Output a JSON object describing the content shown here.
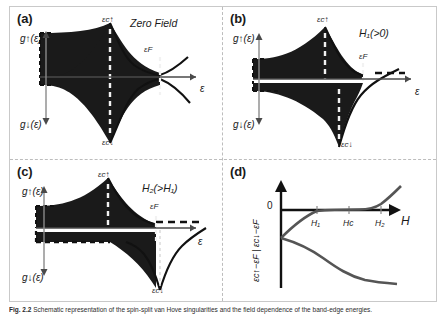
{
  "figure": {
    "caption_bold": "Fig. 2.2",
    "caption_text": "Schematic representation of the spin-split van Hove singularities and the field dependence of the band-edge energies."
  },
  "panels": {
    "a": {
      "label": "(a)",
      "condition": "Zero Field",
      "y_axis_up": "g↑(ε)",
      "y_axis_down": "g↓(ε)",
      "x_axis": "ε",
      "peak_up": "εc↑",
      "peak_down": "εc↓",
      "fermi": "εF"
    },
    "b": {
      "label": "(b)",
      "condition": "H₁(>0)",
      "y_axis_up": "g↑(ε)",
      "y_axis_down": "g↓(ε)",
      "x_axis": "ε",
      "peak_up": "εc↑",
      "peak_down": "εc↓",
      "fermi": "εF"
    },
    "c": {
      "label": "(c)",
      "condition": "H₂(>H₁)",
      "y_axis_up": "g↑(ε)",
      "y_axis_down": "g↓(ε)",
      "x_axis": "ε",
      "peak_up": "εc↑",
      "peak_down": "εc↓",
      "fermi": "εF"
    },
    "d": {
      "label": "(d)",
      "y_axis": "εc↑−εF  |  εc↓−εF",
      "x_axis": "H",
      "zero": "0",
      "ticks": [
        "H₁",
        "Hc",
        "H₂"
      ]
    }
  },
  "colors": {
    "fill": "#1a1a1a",
    "curve": "#111111",
    "axis": "#4a4a4a",
    "dashed_white": "#f2f2f2",
    "divider": "#bdbdbd",
    "frame": "#c9c9c9"
  }
}
